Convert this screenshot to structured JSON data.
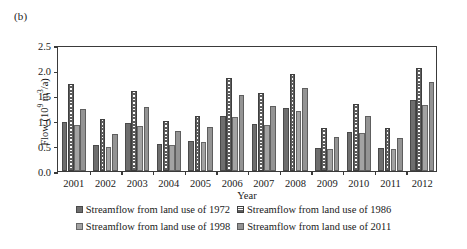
{
  "panel_label": "(b)",
  "chart_data": {
    "type": "bar",
    "title": "",
    "subtitle": "",
    "xlabel": "Year",
    "ylabel": "Flow (10^9 m^3/a)",
    "ylabel_parts": {
      "prefix": "Flow (10",
      "exp1": "9",
      "mid": " m",
      "exp2": "3",
      "suffix": "/a)"
    },
    "ylim": [
      0.0,
      2.5
    ],
    "ytick_values": [
      0.0,
      0.5,
      1.0,
      1.5,
      2.0,
      2.5
    ],
    "ytick_labels": [
      "0.0",
      "0.5",
      "1.0",
      "1.5",
      "2.0",
      "2.5"
    ],
    "grid": false,
    "legend_position": "bottom",
    "categories": [
      "2001",
      "2002",
      "2003",
      "2004",
      "2005",
      "2006",
      "2007",
      "2008",
      "2009",
      "2010",
      "2011",
      "2012"
    ],
    "series": [
      {
        "name": "Streamflow from land use of 1972",
        "color": "#6e6e6e",
        "pattern": "solid",
        "values": [
          0.97,
          0.52,
          0.96,
          0.53,
          0.6,
          1.09,
          0.94,
          1.25,
          0.45,
          0.77,
          0.45,
          1.4
        ]
      },
      {
        "name": "Streamflow from land use of 1986",
        "color": "#5d5d5d",
        "pattern": "dotted-vertical",
        "values": [
          1.72,
          1.03,
          1.58,
          0.99,
          1.1,
          1.84,
          1.54,
          1.93,
          0.85,
          1.32,
          0.85,
          2.04
        ]
      },
      {
        "name": "Streamflow from land use of 1998",
        "color": "#a3a3a3",
        "pattern": "solid",
        "values": [
          0.91,
          0.48,
          0.9,
          0.51,
          0.57,
          1.07,
          0.91,
          1.19,
          0.44,
          0.75,
          0.44,
          1.31
        ]
      },
      {
        "name": "Streamflow from land use of 2011",
        "color": "#949494",
        "pattern": "solid",
        "values": [
          1.24,
          0.73,
          1.27,
          0.79,
          0.87,
          1.5,
          1.29,
          1.64,
          0.68,
          1.09,
          0.66,
          1.77
        ]
      }
    ]
  },
  "legend": {
    "row1": [
      "Streamflow from land use of 1972",
      "Streamflow from land use of 1986"
    ],
    "row2": [
      "Streamflow from land use of 1998",
      "Streamflow from land use of 2011"
    ]
  }
}
